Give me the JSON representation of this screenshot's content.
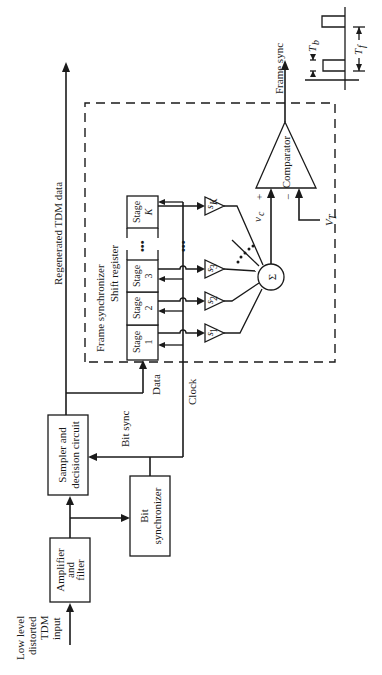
{
  "diagram": {
    "orientation": "rotated-90-ccw",
    "input": {
      "label_lines": [
        "Low level",
        "distorted",
        "TDM",
        "input"
      ]
    },
    "blocks": {
      "amplifier": {
        "lines": [
          "Amplifier",
          "and",
          "filter"
        ]
      },
      "sampler": {
        "lines": [
          "Sampler and",
          "decision circuit"
        ]
      },
      "bit_synchronizer": {
        "lines": [
          "Bit",
          "synchronizer"
        ]
      },
      "comparator": {
        "label": "Comparator"
      },
      "summer": {
        "label": "Σ"
      }
    },
    "signals": {
      "regenerated": "Regenerated TDM data",
      "bit_sync": "Bit sync",
      "data": "Data",
      "clock": "Clock",
      "frame_sync": "Frame sync",
      "vc": "v",
      "vc_sub": "c",
      "vt": "V",
      "vt_sub": "T",
      "plus": "+",
      "minus": "−"
    },
    "frame_synchronizer": {
      "title": "Frame synchronizer",
      "shift_register": "Shift register",
      "stages": [
        {
          "top": "Stage",
          "bottom": "1"
        },
        {
          "top": "Stage",
          "bottom": "2"
        },
        {
          "top": "Stage",
          "bottom": "3"
        },
        {
          "top": "Stage",
          "bottom": "K"
        }
      ],
      "ellipsis": "•••",
      "weights": [
        {
          "base": "s",
          "sub": "1"
        },
        {
          "base": "s",
          "sub": "2"
        },
        {
          "base": "s",
          "sub": "3"
        },
        {
          "base": "s",
          "sub": "K"
        }
      ]
    },
    "timing_inset": {
      "tb": {
        "base": "T",
        "sub": "b"
      },
      "tf": {
        "base": "T",
        "sub": "f"
      }
    }
  }
}
